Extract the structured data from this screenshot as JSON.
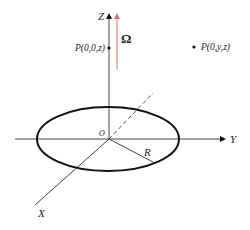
{
  "diagram": {
    "axes": {
      "z_label": "Z",
      "y_label": "Y",
      "x_label": "X",
      "origin_label": "O"
    },
    "disc": {
      "radius_label": "R"
    },
    "rotation": {
      "label": "Ω",
      "color": "#e07070"
    },
    "points": {
      "on_axis": "P(0,0,z)",
      "off_axis": "P(0,y,z)"
    },
    "colors": {
      "axis": "#444444",
      "disc": "#111111",
      "dashed": "#555555"
    }
  }
}
